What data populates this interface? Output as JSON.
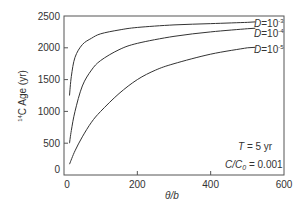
{
  "chart_data": {
    "type": "line",
    "title": "",
    "xlabel": "θ/b",
    "ylabel": "¹⁴C Age (yr)",
    "xlim": [
      0,
      600
    ],
    "ylim": [
      0,
      2500
    ],
    "xticks": [
      0,
      200,
      400,
      600
    ],
    "yticks": [
      0,
      500,
      1000,
      1500,
      2000,
      2500
    ],
    "grid": false,
    "series": [
      {
        "name": "D=10-3",
        "label_base": "D=10",
        "label_exp": "-3",
        "x": [
          15,
          20,
          30,
          50,
          75,
          100,
          150,
          200,
          300,
          400,
          500
        ],
        "y": [
          1250,
          1550,
          1850,
          2050,
          2150,
          2220,
          2280,
          2320,
          2360,
          2380,
          2400
        ]
      },
      {
        "name": "D=10-4",
        "label_base": "D=10",
        "label_exp": "-4",
        "x": [
          15,
          20,
          30,
          50,
          75,
          100,
          150,
          200,
          300,
          400,
          500
        ],
        "y": [
          500,
          700,
          1000,
          1400,
          1650,
          1800,
          1970,
          2070,
          2180,
          2250,
          2300
        ]
      },
      {
        "name": "D=10-5",
        "label_base": "D=10",
        "label_exp": "-5",
        "x": [
          15,
          30,
          50,
          75,
          100,
          150,
          200,
          250,
          300,
          400,
          500
        ],
        "y": [
          170,
          380,
          600,
          830,
          1000,
          1280,
          1500,
          1650,
          1750,
          1900,
          2000
        ]
      }
    ],
    "annotations": [
      {
        "text": "T = 5 yr",
        "italic_part": "T"
      },
      {
        "text": "C/C0 = 0.001",
        "italic_part": "C/C0"
      }
    ]
  },
  "axes": {
    "xlabel_italic": "θ/b",
    "ylabel_sup": "14",
    "ylabel_rest": "C Age (yr)"
  },
  "annotations": {
    "t_var": "T",
    "t_rest": " = 5 yr",
    "c_var": "C/C",
    "c_sub": "0",
    "c_rest": " = 0.001"
  },
  "legend": {
    "d_var": "D",
    "d_eq": "=10",
    "exp3": "-3",
    "exp4": "-4",
    "exp5": "-5"
  },
  "colors": {
    "line": "#333333",
    "axis": "#444444",
    "text": "#333333"
  }
}
